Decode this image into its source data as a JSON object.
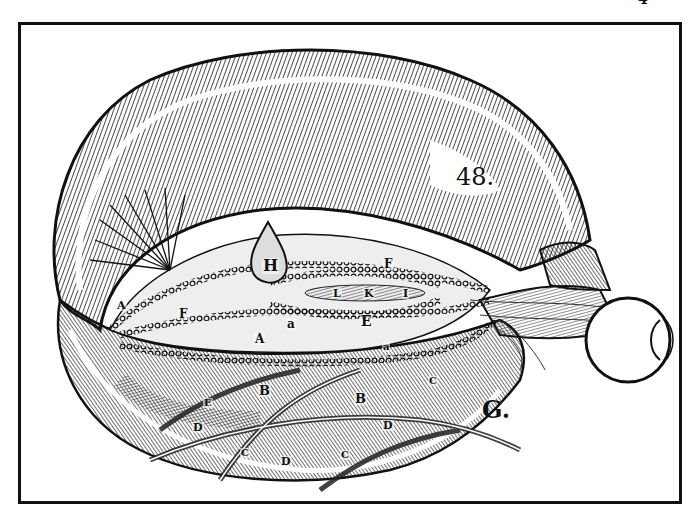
{
  "figure": {
    "page_number": "4",
    "plate_number": "48.",
    "figure_letter": "G.",
    "labels": [
      {
        "text": "H",
        "x": 262,
        "y": 258,
        "size": 16
      },
      {
        "text": "F",
        "x": 383,
        "y": 258,
        "size": 12
      },
      {
        "text": "L",
        "x": 332,
        "y": 288,
        "size": 11
      },
      {
        "text": "K",
        "x": 363,
        "y": 288,
        "size": 11
      },
      {
        "text": "I",
        "x": 402,
        "y": 288,
        "size": 11
      },
      {
        "text": "E",
        "x": 360,
        "y": 314,
        "size": 14
      },
      {
        "text": "F",
        "x": 178,
        "y": 308,
        "size": 12
      },
      {
        "text": "a",
        "x": 286,
        "y": 318,
        "size": 12
      },
      {
        "text": "A",
        "x": 254,
        "y": 333,
        "size": 12
      },
      {
        "text": "A",
        "x": 116,
        "y": 300,
        "size": 11
      },
      {
        "text": "a",
        "x": 382,
        "y": 342,
        "size": 10
      },
      {
        "text": "B",
        "x": 258,
        "y": 384,
        "size": 13
      },
      {
        "text": "B",
        "x": 354,
        "y": 392,
        "size": 13
      },
      {
        "text": "E",
        "x": 203,
        "y": 398,
        "size": 10
      },
      {
        "text": "D",
        "x": 192,
        "y": 422,
        "size": 11
      },
      {
        "text": "D",
        "x": 382,
        "y": 420,
        "size": 11
      },
      {
        "text": "C",
        "x": 428,
        "y": 376,
        "size": 10
      },
      {
        "text": "C",
        "x": 240,
        "y": 448,
        "size": 10
      },
      {
        "text": "D",
        "x": 280,
        "y": 456,
        "size": 11
      },
      {
        "text": "C",
        "x": 340,
        "y": 450,
        "size": 10
      }
    ]
  }
}
